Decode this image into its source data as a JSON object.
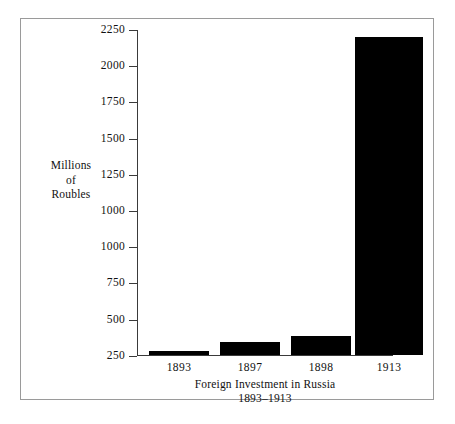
{
  "figure": {
    "frame_color": "#9a9a9a",
    "background": "#ffffff",
    "axis_color": "#3a3a3a",
    "bar_color": "#000000"
  },
  "y_axis_title": {
    "line1": "Millions",
    "line2": "of",
    "line3": "Roubles"
  },
  "caption": {
    "line1": "Foreign Investment in Russia",
    "line2": "1893–1913"
  },
  "chart_data": {
    "type": "bar",
    "title": "Foreign Investment in Russia",
    "subtitle": "1893–1913",
    "xlabel": "",
    "ylabel": "Millions of Roubles",
    "categories": [
      "1893",
      "1897",
      "1898",
      "1913"
    ],
    "values": [
      30,
      90,
      130,
      2200
    ],
    "ylim": [
      0,
      2250
    ],
    "ytick_values": [
      2250,
      2000,
      1750,
      1500,
      1250,
      1000,
      1000,
      750,
      500,
      250
    ],
    "ytick_labels": [
      "2250",
      "2000",
      "1750",
      "1500",
      "1250",
      "1000",
      "1000",
      "750",
      "500",
      "250"
    ],
    "ytick_note": "Axis labels as printed in the source image; the value 1000 is printed twice on consecutive ticks.",
    "grid": false,
    "legend": false,
    "bar_color": "#000000"
  }
}
